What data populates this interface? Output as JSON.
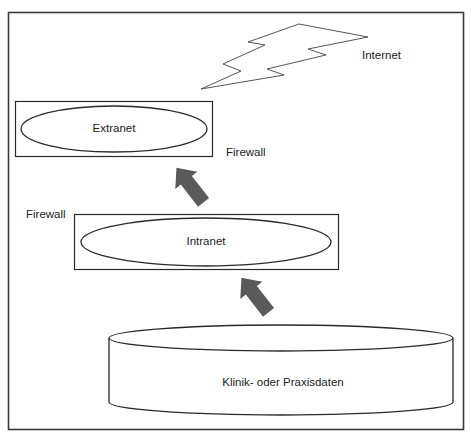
{
  "diagram": {
    "colors": {
      "stroke": "#2a2a2a",
      "frame": "#3a3a3a",
      "arrow_fill": "#5a5a5a",
      "text": "#222222",
      "background": "#ffffff"
    },
    "nodes": {
      "internet": {
        "label": "Internet",
        "shape": "lightning-bolt"
      },
      "extranet": {
        "label": "Extranet",
        "shape": "ellipse-in-rectangle"
      },
      "intranet": {
        "label": "Intranet",
        "shape": "ellipse-in-rectangle"
      },
      "database": {
        "label": "Klinik- oder Praxisdaten",
        "shape": "cylinder"
      }
    },
    "firewalls": {
      "upper": {
        "label": "Firewall"
      },
      "lower": {
        "label": "Firewall"
      }
    },
    "arrows": [
      {
        "from": "database",
        "to": "intranet",
        "direction": "up-left"
      },
      {
        "from": "intranet",
        "to": "extranet",
        "direction": "up-left"
      }
    ]
  }
}
